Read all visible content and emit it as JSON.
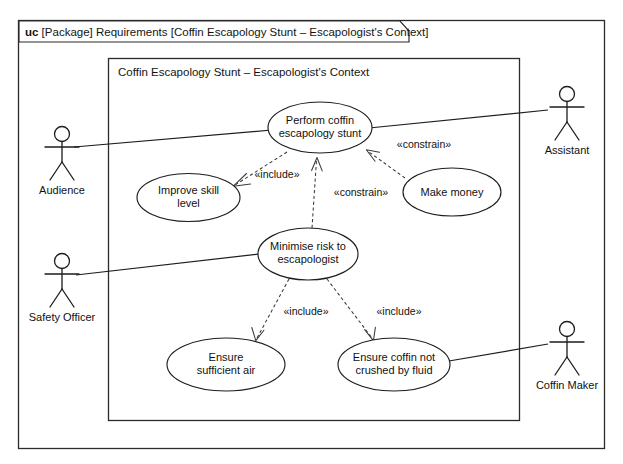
{
  "diagram": {
    "kind": "uml-use-case-diagram",
    "header": {
      "keyword": "uc",
      "text": " [Package] Requirements [Coffin Escapology Stunt – Escapologist's Context]"
    },
    "subject_frame": {
      "label": "Coffin Escapology Stunt – Escapologist's Context"
    },
    "use_cases": [
      {
        "id": "perform",
        "line1": "Perform coffin",
        "line2": "escapology stunt"
      },
      {
        "id": "improve",
        "line1": "Improve skill",
        "line2": "level"
      },
      {
        "id": "money",
        "line1": "Make money",
        "line2": ""
      },
      {
        "id": "minimise",
        "line1": "Minimise risk to",
        "line2": "escapologist"
      },
      {
        "id": "air",
        "line1": "Ensure",
        "line2": "sufficient air"
      },
      {
        "id": "crush",
        "line1": "Ensure coffin not",
        "line2": "crushed by fluid"
      }
    ],
    "actors": [
      {
        "id": "audience",
        "label": "Audience"
      },
      {
        "id": "safety",
        "label": "Safety Officer"
      },
      {
        "id": "assistant",
        "label": "Assistant"
      },
      {
        "id": "coffinmaker",
        "label": "Coffin Maker"
      }
    ],
    "relationships": [
      {
        "id": "r1",
        "from": "perform",
        "to": "improve",
        "stereotype": "«include»",
        "kind": "include"
      },
      {
        "id": "r2",
        "from": "minimise",
        "to": "perform",
        "stereotype": "«constrain»",
        "kind": "constrain"
      },
      {
        "id": "r3",
        "from": "money",
        "to": "perform",
        "stereotype": "«constrain»",
        "kind": "constrain"
      },
      {
        "id": "r4",
        "from": "minimise",
        "to": "air",
        "stereotype": "«include»",
        "kind": "include"
      },
      {
        "id": "r5",
        "from": "minimise",
        "to": "crush",
        "stereotype": "«include»",
        "kind": "include"
      }
    ],
    "associations": [
      {
        "id": "a1",
        "actor": "audience",
        "use_case": "perform"
      },
      {
        "id": "a2",
        "actor": "assistant",
        "use_case": "perform"
      },
      {
        "id": "a3",
        "actor": "safety",
        "use_case": "minimise"
      },
      {
        "id": "a4",
        "actor": "coffinmaker",
        "use_case": "crush"
      }
    ],
    "colors": {
      "stroke": "#1d1d1d",
      "dashed": "#3a3a3a",
      "background": "#ffffff",
      "text": "#111111"
    }
  }
}
